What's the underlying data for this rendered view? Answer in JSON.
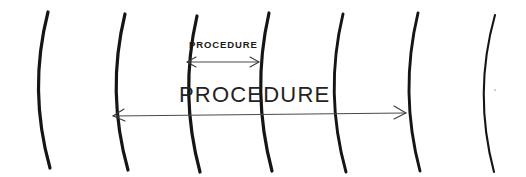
{
  "figure": {
    "background_color": "#ffffff",
    "stroke_color": "#151515",
    "dimension_color": "#4a4a4a",
    "width": 526,
    "height": 177
  },
  "labels": {
    "small_label": "PROCEDURE",
    "large_label": "PROCEDURE"
  },
  "arcs": [
    {
      "name": "arc-1",
      "top_x": 48,
      "mid_x": 32,
      "bottom_x": 50,
      "top_y": 12,
      "bottom_y": 168,
      "weight": "thick"
    },
    {
      "name": "arc-2",
      "top_x": 125,
      "mid_x": 112,
      "bottom_x": 128,
      "top_y": 14,
      "bottom_y": 170,
      "weight": "thick"
    },
    {
      "name": "arc-3",
      "top_x": 197,
      "mid_x": 185,
      "bottom_x": 200,
      "top_y": 16,
      "bottom_y": 172,
      "weight": "thick"
    },
    {
      "name": "arc-4",
      "top_x": 269,
      "mid_x": 257,
      "bottom_x": 272,
      "top_y": 13,
      "bottom_y": 171,
      "weight": "thick"
    },
    {
      "name": "arc-5",
      "top_x": 343,
      "mid_x": 330,
      "bottom_x": 346,
      "top_y": 14,
      "bottom_y": 172,
      "weight": "medium"
    },
    {
      "name": "arc-6",
      "top_x": 418,
      "mid_x": 405,
      "bottom_x": 420,
      "top_y": 13,
      "bottom_y": 171,
      "weight": "medium"
    },
    {
      "name": "arc-7",
      "top_x": 495,
      "mid_x": 478,
      "bottom_x": 494,
      "top_y": 15,
      "bottom_y": 172,
      "weight": "thin"
    }
  ],
  "dimensions": [
    {
      "name": "short-procedure-span",
      "label": "PROCEDURE",
      "x_start": 187,
      "x_end": 259,
      "y": 62,
      "label_x": 189,
      "label_y": 47,
      "spans": "arc-3 to arc-4"
    },
    {
      "name": "long-procedure-span",
      "label": "PROCEDURE",
      "x_start": 113,
      "x_end": 406,
      "y": 116,
      "label_x": 180,
      "label_y": 102,
      "spans": "arc-2 to arc-6"
    }
  ]
}
